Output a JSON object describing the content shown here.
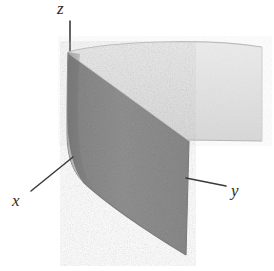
{
  "figure": {
    "background_color": "#ffffff"
  },
  "axes": {
    "x": {
      "label": "x",
      "line": {
        "x1": 31,
        "y1": 191,
        "x2": 73,
        "y2": 157
      },
      "color": "#3a3a3a"
    },
    "y": {
      "label": "y",
      "line": {
        "x1": 186,
        "y1": 178,
        "x2": 226,
        "y2": 186
      },
      "color": "#3a3a3a"
    },
    "z": {
      "label": "z",
      "line": {
        "x1": 70,
        "y1": 21,
        "x2": 70,
        "y2": 60
      },
      "color": "#3a3a3a"
    }
  },
  "surface": {
    "kind": "cylinder-sheet",
    "light_face_color": "#e4e4e4",
    "dark_face_color": "#8e8e8e",
    "edge_color": "#9a9a9a",
    "shading_boundary": {
      "from": {
        "x": 69,
        "y": 54
      },
      "to": {
        "x": 189,
        "y": 141
      }
    },
    "top_edge": {
      "left": {
        "x": 68,
        "y": 52
      },
      "apex": {
        "x": 170,
        "y": 41
      },
      "right": {
        "x": 262,
        "y": 47
      }
    },
    "bottom_edge": {
      "left": {
        "x": 83,
        "y": 182
      },
      "right": {
        "x": 186,
        "y": 255
      }
    },
    "right_panel_bottom": {
      "left": {
        "x": 188,
        "y": 140
      },
      "right": {
        "x": 262,
        "y": 141
      }
    }
  },
  "colors": {
    "ink": "#2b2b2b",
    "axis": "#3a3a3a",
    "light_gray": "#e4e4e4",
    "mid_gray": "#8e8e8e",
    "paper": "#ffffff"
  }
}
